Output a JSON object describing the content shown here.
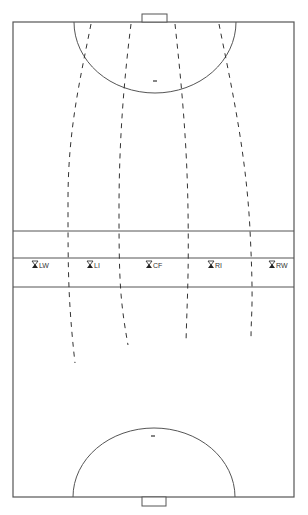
{
  "diagram": {
    "title": "",
    "field": {
      "left": 13,
      "top": 22,
      "right": 294,
      "bottom": 497,
      "line_color": "#555555"
    },
    "goals": [
      {
        "id": "top-goal",
        "x": 142,
        "y": 14,
        "w": 25,
        "h": 8
      },
      {
        "id": "bottom-goal",
        "x": 142,
        "y": 497,
        "w": 24,
        "h": 9
      }
    ],
    "arcs": [
      {
        "id": "top-arc",
        "cx": 155,
        "cy": 22,
        "rx": 81,
        "ry": 71
      },
      {
        "id": "bottom-arc",
        "cx": 154,
        "cy": 497,
        "rx": 81,
        "ry": 69
      }
    ],
    "penalty_marks": [
      {
        "id": "top-mark",
        "x": 155,
        "y": 81
      },
      {
        "id": "bottom-mark",
        "x": 153,
        "y": 436
      }
    ],
    "horizontal_lines": [
      231,
      258,
      287
    ],
    "players": [
      {
        "label": "LW",
        "x": 35,
        "y": 265
      },
      {
        "label": "LI",
        "x": 90,
        "y": 265
      },
      {
        "label": "CF",
        "x": 149,
        "y": 265
      },
      {
        "label": "RI",
        "x": 211,
        "y": 265
      },
      {
        "label": "RW",
        "x": 272,
        "y": 265
      }
    ],
    "runs": [
      {
        "id": "run-1",
        "path": "M91,24 C80,80 68,130 68,200 S68,300 75,363"
      },
      {
        "id": "run-2",
        "path": "M131,24 C124,80 119,140 119,210 S120,300 128,345"
      },
      {
        "id": "run-3",
        "path": "M175,24 C181,80 187,140 188,210 S187,300 186,343"
      },
      {
        "id": "run-4",
        "path": "M219,24 C230,80 246,150 250,230 S251,310 251,340"
      }
    ]
  }
}
